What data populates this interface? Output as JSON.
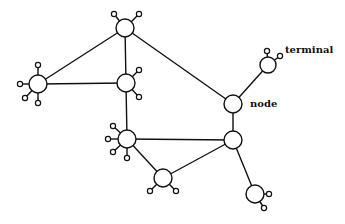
{
  "diagram": {
    "type": "network-topology",
    "labels": {
      "terminal": "terminal",
      "node": "node"
    },
    "colors": {
      "stroke": "#111111",
      "background": "#ffffff"
    },
    "nodes": [
      {
        "id": "n1",
        "x": 125,
        "y": 28,
        "r": 9,
        "terminals": [
          [
            114,
            14
          ],
          [
            139,
            14
          ]
        ]
      },
      {
        "id": "n2",
        "x": 38,
        "y": 84,
        "r": 9,
        "terminals": [
          [
            38,
            65
          ],
          [
            20,
            84
          ],
          [
            25,
            98
          ],
          [
            38,
            103
          ]
        ]
      },
      {
        "id": "n3",
        "x": 126,
        "y": 83,
        "r": 9,
        "terminals": [
          [
            139,
            70
          ],
          [
            139,
            97
          ]
        ]
      },
      {
        "id": "n4",
        "x": 127,
        "y": 139,
        "r": 9,
        "terminals": [
          [
            113,
            126
          ],
          [
            108,
            139
          ],
          [
            113,
            152
          ],
          [
            127,
            158
          ]
        ]
      },
      {
        "id": "n5",
        "x": 163,
        "y": 178,
        "r": 9,
        "terminals": [
          [
            150,
            191
          ],
          [
            176,
            191
          ]
        ]
      },
      {
        "id": "n6",
        "x": 233,
        "y": 104,
        "r": 9,
        "terminals": [],
        "label": "node"
      },
      {
        "id": "n7",
        "x": 233,
        "y": 140,
        "r": 9,
        "terminals": []
      },
      {
        "id": "n8",
        "x": 268,
        "y": 65,
        "r": 8,
        "terminals": [
          [
            267,
            51
          ],
          [
            280,
            56
          ]
        ],
        "label": "terminal"
      },
      {
        "id": "n9",
        "x": 255,
        "y": 194,
        "r": 9,
        "terminals": [
          [
            269,
            194
          ],
          [
            264,
            208
          ]
        ]
      }
    ],
    "edges": [
      [
        "n1",
        "n2"
      ],
      [
        "n1",
        "n3"
      ],
      [
        "n1",
        "n6"
      ],
      [
        "n2",
        "n3"
      ],
      [
        "n3",
        "n4"
      ],
      [
        "n4",
        "n7"
      ],
      [
        "n4",
        "n5"
      ],
      [
        "n5",
        "n7"
      ],
      [
        "n6",
        "n7"
      ],
      [
        "n6",
        "n8"
      ],
      [
        "n7",
        "n9"
      ]
    ]
  }
}
